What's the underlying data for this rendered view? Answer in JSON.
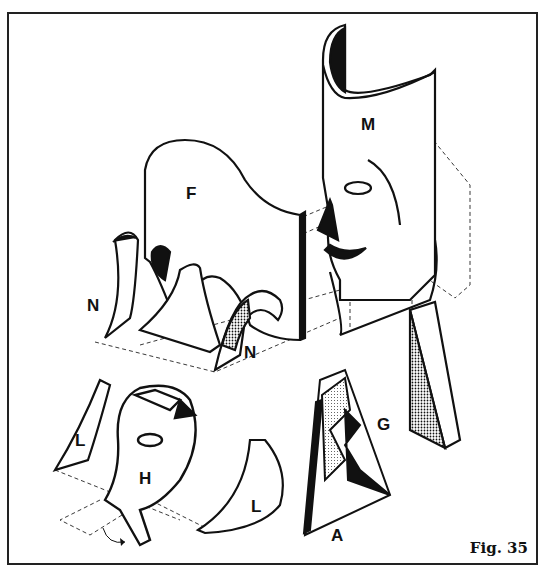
{
  "figure": {
    "caption": "Fig. 35",
    "labels": {
      "M": "M",
      "F": "F",
      "N_left": "N",
      "N_right": "N",
      "G": "G",
      "L_left": "L",
      "L_right": "L",
      "H": "H",
      "A": "A"
    },
    "colors": {
      "ink": "#111111",
      "paper": "#ffffff",
      "frame": "#222222"
    }
  }
}
